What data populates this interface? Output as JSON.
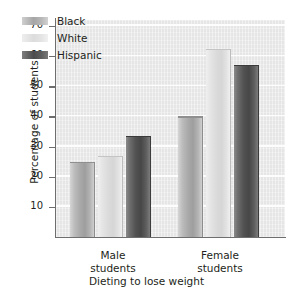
{
  "chart_data": {
    "type": "bar",
    "title": "",
    "xlabel": "Dieting to lose weight",
    "ylabel": "Percentage of students",
    "categories": [
      "Male students",
      "Female students"
    ],
    "category_lines": [
      [
        "Male",
        "students"
      ],
      [
        "Female",
        "students"
      ]
    ],
    "series": [
      {
        "name": "Black",
        "color": "#a9a9a9",
        "values": [
          25,
          40
        ]
      },
      {
        "name": "White",
        "color": "#dadada",
        "values": [
          27,
          62.5
        ]
      },
      {
        "name": "Hispanic",
        "color": "#525252",
        "values": [
          33.5,
          57
        ]
      }
    ],
    "ylim": [
      0,
      72
    ],
    "yticks": [
      10,
      20,
      30,
      40,
      50,
      60,
      70
    ],
    "ytick_labels": [
      "10",
      "20",
      "30",
      "40",
      "50",
      "60",
      "70"
    ],
    "grid": true,
    "grid_orientation": "horizontal",
    "legend_position": "upper-left-inside",
    "plot_background": "#ebebeb",
    "axis_color": "#6e6e6e",
    "text_color": "#231f20"
  },
  "legend": {
    "items": [
      {
        "label": "Black"
      },
      {
        "label": "White"
      },
      {
        "label": "Hispanic"
      }
    ]
  },
  "axes": {
    "y_title": "Percentage of students",
    "x_title": "Dieting to lose weight",
    "y_tick_labels": [
      "70",
      "60",
      "50",
      "40",
      "30",
      "20",
      "10"
    ]
  },
  "groups": [
    {
      "line1": "Male",
      "line2": "students"
    },
    {
      "line1": "Female",
      "line2": "students"
    }
  ]
}
